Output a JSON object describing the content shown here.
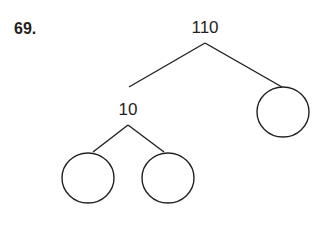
{
  "problem": {
    "number": "69.",
    "diagram": {
      "type": "number-bond-tree",
      "root": {
        "label": "110"
      },
      "children": [
        {
          "label": "10",
          "children": [
            {
              "label": ""
            },
            {
              "label": ""
            }
          ]
        },
        {
          "label": ""
        }
      ]
    },
    "colors": {
      "ink": "#231f20",
      "background": "#ffffff"
    }
  }
}
